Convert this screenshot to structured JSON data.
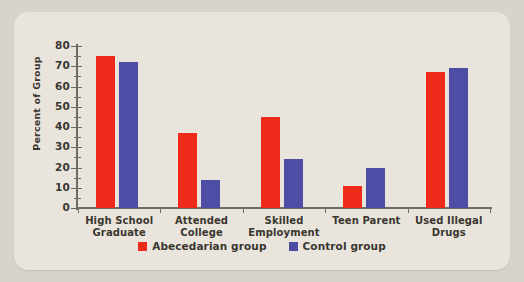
{
  "chart_data": {
    "type": "bar",
    "title": "",
    "xlabel": "",
    "ylabel": "Percent of Group",
    "ylim": [
      0,
      80
    ],
    "ytick_step": 10,
    "yticks": [
      0,
      10,
      20,
      30,
      40,
      50,
      60,
      70,
      80
    ],
    "ytick_labels": [
      "0",
      "10",
      "20",
      "30",
      "40",
      "50",
      "60",
      "70",
      "80"
    ],
    "grid": false,
    "legend_position": "bottom-center",
    "categories": [
      "High School\nGraduate",
      "Attended\nCollege",
      "Skilled\nEmployment",
      "Teen Parent",
      "Used Illegal\nDrugs"
    ],
    "category_lines": [
      [
        "High School",
        "Graduate"
      ],
      [
        "Attended",
        "College"
      ],
      [
        "Skilled",
        "Employment"
      ],
      [
        "Teen Parent",
        ""
      ],
      [
        "Used Illegal",
        "Drugs"
      ]
    ],
    "series": [
      {
        "name": "Abecedarian group",
        "color": "#ee2a1b",
        "values": [
          75,
          37,
          45,
          11,
          67
        ]
      },
      {
        "name": "Control group",
        "color": "#4d4da6",
        "values": [
          72,
          14,
          24,
          20,
          69
        ]
      }
    ]
  },
  "legend": {
    "items": [
      {
        "label": "Abecedarian group",
        "color": "#ee2a1b"
      },
      {
        "label": "Control group",
        "color": "#4d4da6"
      }
    ]
  },
  "colors": {
    "card_background": "#e9e5dc",
    "page_background": "#d8d4cb",
    "axis": "#6e6a64",
    "text": "#3a3630",
    "series_red": "#ee2a1b",
    "series_blue": "#4d4da6"
  }
}
